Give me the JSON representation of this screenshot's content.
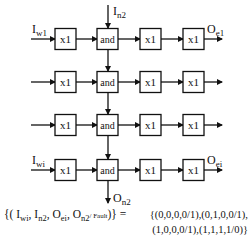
{
  "diagram": {
    "rows": [
      {
        "y": 39,
        "input_label": "I",
        "input_sub": "w1",
        "output_label": "O",
        "output_sub": "e1"
      },
      {
        "y": 82,
        "input_label": "",
        "input_sub": "",
        "output_label": "",
        "output_sub": ""
      },
      {
        "y": 125,
        "input_label": "",
        "input_sub": "",
        "output_label": "",
        "output_sub": ""
      },
      {
        "y": 170,
        "input_label": "I",
        "input_sub": "wi",
        "output_label": "O",
        "output_sub": "ei"
      }
    ],
    "cells": [
      "x1",
      "and",
      "x1",
      "x1"
    ],
    "top_input": {
      "label": "I",
      "sub": "n2"
    },
    "bottom_output": {
      "label": "O",
      "sub": "n2"
    },
    "formula": {
      "lhs_open": "{(",
      "terms": [
        {
          "label": "I",
          "sub": "wi"
        },
        {
          "label": "I",
          "sub": "n2"
        },
        {
          "label": "O",
          "sub": "ei"
        },
        {
          "label": "O",
          "sub": "n2"
        }
      ],
      "fault_label": "/ Fault",
      "lhs_close": ")} =",
      "rhs_line1": "{(0,0,0,0/1),(0,1,0,0/1),",
      "rhs_line2": "(1,0,0,0/1),(1,1,1,1/0)}"
    }
  }
}
